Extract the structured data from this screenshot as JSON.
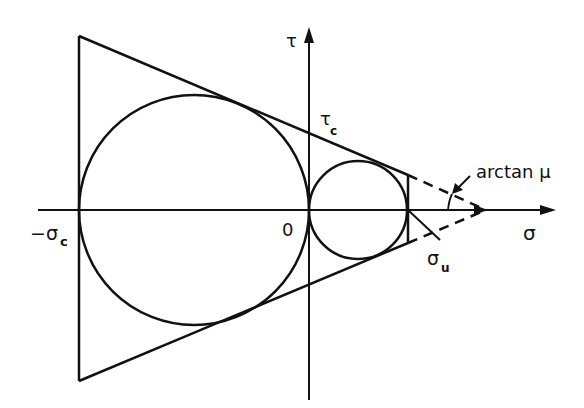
{
  "diagram": {
    "type": "Mohr-Coulomb failure envelope",
    "axes": {
      "horizontal": {
        "label": "σ"
      },
      "vertical": {
        "label": "τ"
      }
    },
    "labels": {
      "origin": "0",
      "neg_sigma_c": "−σ",
      "neg_sigma_c_sub": "c",
      "tau_c": "τ",
      "tau_c_sub": "c",
      "sigma_u": "σ",
      "sigma_u_sub": "u",
      "angle": "arctan μ"
    },
    "colors": {
      "ink": "#111111",
      "background": "#ffffff"
    }
  }
}
